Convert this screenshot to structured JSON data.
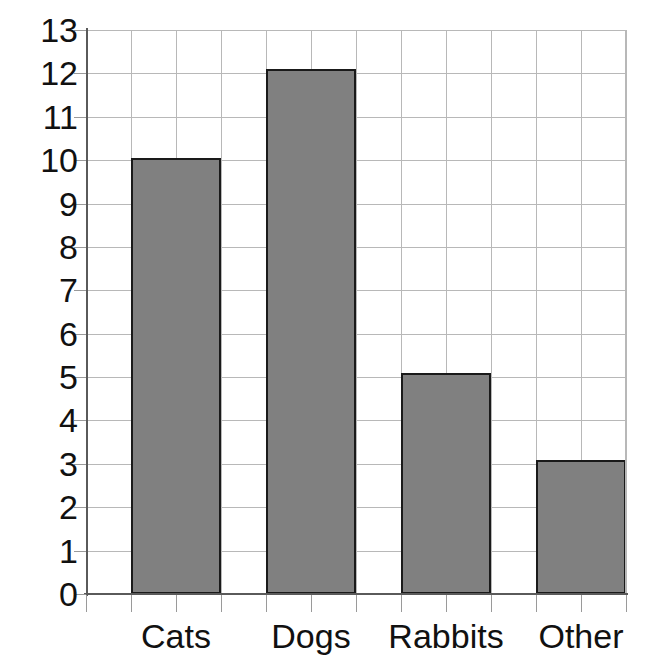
{
  "chart_data": {
    "type": "bar",
    "title": "",
    "subtitle": "",
    "xlabel": "",
    "ylabel": "",
    "categories": [
      "Cats",
      "Dogs",
      "Rabbits",
      "Other"
    ],
    "values": [
      10.05,
      12.1,
      5.1,
      3.1
    ],
    "series": [
      {
        "name": "",
        "values": [
          10.05,
          12.1,
          5.1,
          3.1
        ]
      }
    ],
    "ylim": [
      0,
      13
    ],
    "xlim": [
      0,
      12
    ],
    "y_ticks": [
      0,
      1,
      2,
      3,
      4,
      5,
      6,
      7,
      8,
      9,
      10,
      11,
      12,
      13
    ],
    "y_tick_labels": [
      "0",
      "1",
      "2",
      "3",
      "4",
      "5",
      "6",
      "7",
      "8",
      "9",
      "10",
      "11",
      "12",
      "13"
    ],
    "x_tick_labels": [
      "Cats",
      "Dogs",
      "Rabbits",
      "Other"
    ],
    "grid": true,
    "grid_axes": "both",
    "legend": false,
    "legend_position": "none",
    "annotations": [],
    "colors": {
      "bar_fill": "#808080",
      "bar_border": "#1a1a1a",
      "gridline": "#b8b8b8",
      "axis_line": "#5a5a5a",
      "tick_mark": "#9a9a9a",
      "text": "#111111",
      "background": "#ffffff"
    },
    "vertical_gridline_count": 12,
    "bar_columns_wide": 2,
    "bar_gap_columns": 1
  }
}
